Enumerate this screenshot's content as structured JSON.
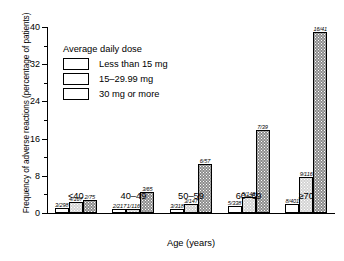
{
  "chart_data": {
    "type": "bar",
    "title": "",
    "xlabel": "Age (years)",
    "ylabel": "Frequency of adverse reactions (percentage of patients)",
    "categories": [
      "<40",
      "40–49",
      "50–59",
      "60–69",
      "≥70"
    ],
    "ylim": [
      0,
      40
    ],
    "yticks": [
      0,
      8,
      16,
      24,
      32,
      40
    ],
    "ytick_labels": [
      "0",
      "8",
      "16",
      "24",
      "32",
      "40"
    ],
    "yminor_step": 4,
    "grid": false,
    "legend_position": "upper-left",
    "legend_title": "Average daily dose",
    "series": [
      {
        "name": "Less than 15 mg",
        "fill": "white",
        "values": [
          1.0,
          0.9,
          0.9,
          1.5,
          2.0
        ],
        "labels": [
          "3/298",
          "2/217",
          "3/318",
          "5/338",
          "8/401"
        ]
      },
      {
        "name": "15–29.99 mg",
        "fill": "light-gray-stipple",
        "values": [
          2.4,
          0.9,
          2.0,
          3.4,
          7.8
        ],
        "labels": [
          "4/167",
          "1/116",
          "3/147",
          "5/149",
          "9/116"
        ]
      },
      {
        "name": "30 mg or more",
        "fill": "dark-gray-stipple",
        "values": [
          2.7,
          4.6,
          10.5,
          17.9,
          39.0
        ],
        "labels": [
          "2/75",
          "3/65",
          "6/57",
          "7/39",
          "16/41"
        ]
      }
    ]
  },
  "colors": {
    "axis": "#000000",
    "series_light": "#ffffff",
    "series_mid": "#d4d4d4",
    "series_dark": "#8c8c8c"
  }
}
